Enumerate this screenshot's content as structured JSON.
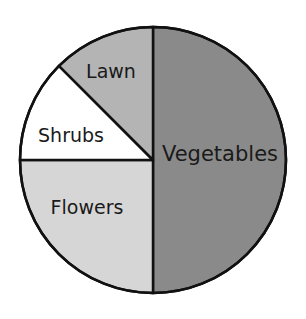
{
  "chart_data": {
    "type": "pie",
    "title": "",
    "categories": [
      "Vegetables",
      "Flowers",
      "Shrubs",
      "Lawn"
    ],
    "values": [
      50,
      25,
      12.5,
      12.5
    ],
    "unit": "percent (estimated from slice angles)",
    "colors": [
      "#8a8a8a",
      "#d6d6d6",
      "#ffffff",
      "#b4b4b4"
    ],
    "start_angle_deg": 90,
    "direction": "clockwise",
    "legend": "none (labels inside slices)",
    "grid": false
  },
  "labels": {
    "vegetables": "Vegetables",
    "flowers": "Flowers",
    "shrubs": "Shrubs",
    "lawn": "Lawn"
  }
}
